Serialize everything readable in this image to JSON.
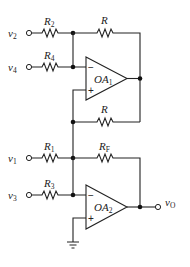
{
  "diagram": {
    "type": "op-amp circuit",
    "inputs": [
      {
        "id": "v2",
        "label": "v",
        "sub": "2"
      },
      {
        "id": "v4",
        "label": "v",
        "sub": "4"
      },
      {
        "id": "v1",
        "label": "v",
        "sub": "1"
      },
      {
        "id": "v3",
        "label": "v",
        "sub": "3"
      }
    ],
    "resistors": {
      "R2": {
        "label": "R",
        "sub": "2"
      },
      "R4": {
        "label": "R",
        "sub": "4"
      },
      "R_top": {
        "label": "R",
        "sub": ""
      },
      "R_bottom": {
        "label": "R",
        "sub": ""
      },
      "R1": {
        "label": "R",
        "sub": "1"
      },
      "R3": {
        "label": "R",
        "sub": "3"
      },
      "RF": {
        "label": "R",
        "sub": "F"
      }
    },
    "opamps": [
      {
        "id": "OA1",
        "label": "OA",
        "sub": "1",
        "minus": "−",
        "plus": "+"
      },
      {
        "id": "OA2",
        "label": "OA",
        "sub": "2",
        "minus": "−",
        "plus": "+"
      }
    ],
    "output": {
      "label": "v",
      "sub": "O"
    }
  }
}
